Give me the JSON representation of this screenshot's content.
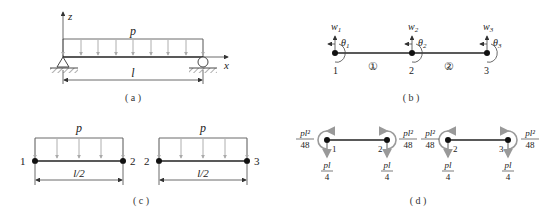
{
  "panels": {
    "a": {
      "caption": "( a )",
      "load_label": "p",
      "length_label": "l",
      "axis_z": "z",
      "axis_x": "x"
    },
    "b": {
      "caption": "( b )",
      "nodes": [
        {
          "id": "1",
          "w": "w",
          "w_sub": "1",
          "theta": "θ",
          "theta_sub": "1"
        },
        {
          "id": "2",
          "w": "w",
          "w_sub": "2",
          "theta": "θ",
          "theta_sub": "2"
        },
        {
          "id": "3",
          "w": "w",
          "w_sub": "3",
          "theta": "θ",
          "theta_sub": "3"
        }
      ],
      "elements": [
        "①",
        "②"
      ]
    },
    "c": {
      "caption": "( c )",
      "elements": [
        {
          "left": "1",
          "right": "2",
          "load_label": "p",
          "length_label": "l/2"
        },
        {
          "left": "2",
          "right": "3",
          "load_label": "p",
          "length_label": "l/2"
        }
      ]
    },
    "d": {
      "caption": "( d )",
      "moment_num": "pl²",
      "moment_den": "48",
      "force_num": "pl",
      "force_den": "4",
      "elements": [
        {
          "left": "1",
          "right": "2"
        },
        {
          "left": "2",
          "right": "3"
        }
      ]
    }
  }
}
